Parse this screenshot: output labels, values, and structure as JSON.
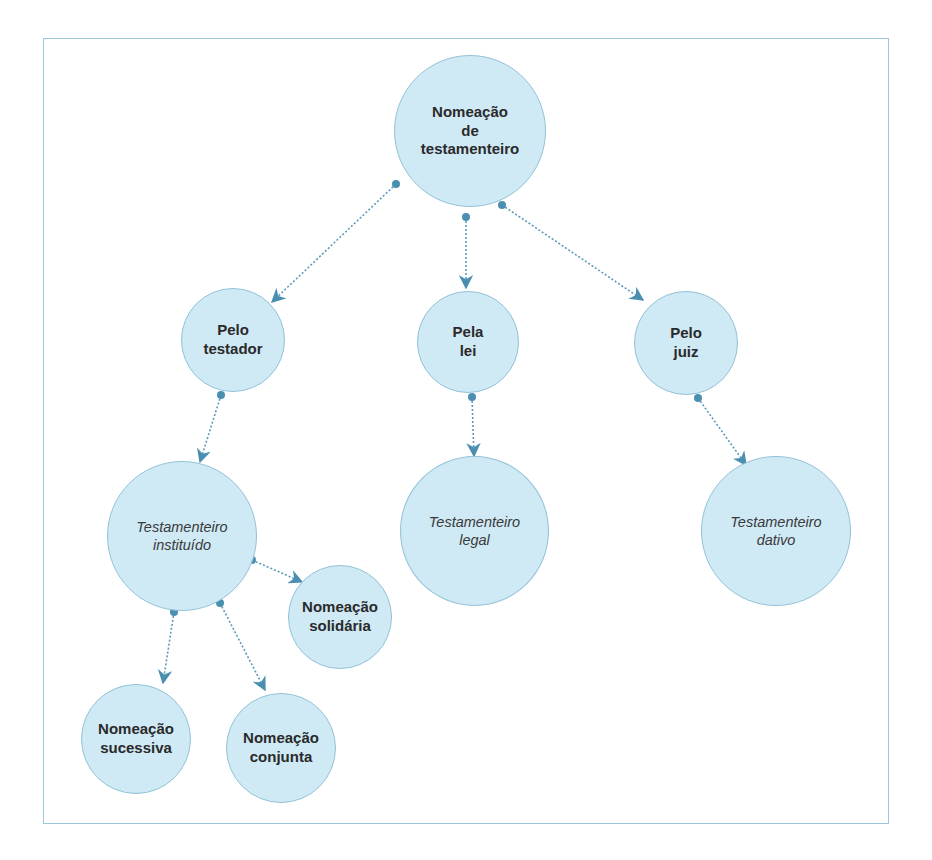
{
  "diagram": {
    "title": "Nomeação de testamenteiro",
    "colors": {
      "frame": "#9cc7da",
      "node_fill": "#cfe9f5",
      "node_border": "#93c2d8",
      "connector": "#4a8fb0"
    },
    "nodes": {
      "root": {
        "lines": [
          "Nomeação",
          "de",
          "testamenteiro"
        ],
        "style": "bold"
      },
      "pelo_testador": {
        "lines": [
          "Pelo",
          "testador"
        ],
        "style": "bold"
      },
      "pela_lei": {
        "lines": [
          "Pela",
          "lei"
        ],
        "style": "bold"
      },
      "pelo_juiz": {
        "lines": [
          "Pelo",
          "juiz"
        ],
        "style": "bold"
      },
      "instituido": {
        "lines": [
          "Testamenteiro",
          "instituído"
        ],
        "style": "italic"
      },
      "legal": {
        "lines": [
          "Testamenteiro",
          "legal"
        ],
        "style": "italic"
      },
      "dativo": {
        "lines": [
          "Testamenteiro",
          "dativo"
        ],
        "style": "italic"
      },
      "solidaria": {
        "lines": [
          "Nomeação",
          "solidária"
        ],
        "style": "bold"
      },
      "sucessiva": {
        "lines": [
          "Nomeação",
          "sucessiva"
        ],
        "style": "bold"
      },
      "conjunta": {
        "lines": [
          "Nomeação",
          "conjunta"
        ],
        "style": "bold"
      }
    },
    "edges": [
      {
        "from": "root",
        "to": "pelo_testador"
      },
      {
        "from": "root",
        "to": "pela_lei"
      },
      {
        "from": "root",
        "to": "pelo_juiz"
      },
      {
        "from": "pelo_testador",
        "to": "instituido"
      },
      {
        "from": "pela_lei",
        "to": "legal"
      },
      {
        "from": "pelo_juiz",
        "to": "dativo"
      },
      {
        "from": "instituido",
        "to": "solidaria"
      },
      {
        "from": "instituido",
        "to": "sucessiva"
      },
      {
        "from": "instituido",
        "to": "conjunta"
      }
    ]
  }
}
